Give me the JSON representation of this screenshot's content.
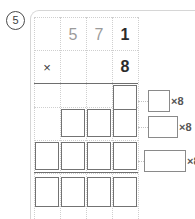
{
  "question": {
    "number": "5"
  },
  "problem": {
    "multiplicand_digits": [
      {
        "value": "5",
        "tone": "light"
      },
      {
        "value": "7",
        "tone": "light"
      },
      {
        "value": "1",
        "tone": "dark"
      }
    ],
    "operator": "×",
    "multiplier_digits": [
      {
        "value": "8",
        "tone": "dark"
      }
    ]
  },
  "partial_rows": [
    {
      "label": "partial-product-row-1",
      "boxes": 1
    },
    {
      "label": "partial-product-row-2",
      "boxes": 3
    },
    {
      "label": "partial-product-row-3",
      "boxes": 4
    },
    {
      "label": "total-row",
      "boxes": 4
    }
  ],
  "carries": [
    {
      "label": "×8",
      "box_width": 22
    },
    {
      "label": "×8",
      "box_width": 30
    },
    {
      "label": "×8",
      "box_width": 42
    }
  ],
  "colors": {
    "panel_border": "#d6d6d6",
    "grid_line": "#cfcfcf",
    "rule_line": "#6e6e6e",
    "box_border": "#737373",
    "digit_light": "#9b9b9b",
    "digit_dark": "#2b2b2b"
  }
}
